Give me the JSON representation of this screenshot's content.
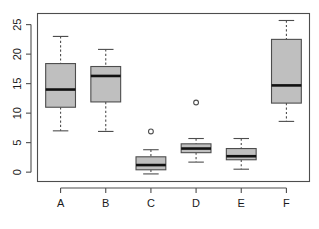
{
  "chart_data": {
    "type": "box",
    "title": "",
    "xlabel": "",
    "ylabel": "",
    "categories": [
      "A",
      "B",
      "C",
      "D",
      "E",
      "F"
    ],
    "ylim": [
      -1.5,
      26.8
    ],
    "yticks": [
      0,
      5,
      10,
      15,
      20,
      25
    ],
    "ytick_labels": [
      "0",
      "5",
      "10",
      "15",
      "20",
      "25"
    ],
    "grid": false,
    "legend": "none",
    "orientation": "vertical",
    "boxes": [
      {
        "category": "A",
        "whisker_low": 7.0,
        "q1": 11.0,
        "median": 14.0,
        "q3": 18.4,
        "whisker_high": 23.0,
        "outliers": []
      },
      {
        "category": "B",
        "whisker_low": 6.9,
        "q1": 11.9,
        "median": 16.3,
        "q3": 17.9,
        "whisker_high": 20.8,
        "outliers": []
      },
      {
        "category": "C",
        "whisker_low": -0.3,
        "q1": 0.4,
        "median": 1.2,
        "q3": 2.6,
        "whisker_high": 3.8,
        "outliers": [
          6.9
        ]
      },
      {
        "category": "D",
        "whisker_low": 1.7,
        "q1": 3.3,
        "median": 4.0,
        "q3": 4.8,
        "whisker_high": 5.7,
        "outliers": [
          11.8
        ]
      },
      {
        "category": "E",
        "whisker_low": 0.5,
        "q1": 2.1,
        "median": 2.7,
        "q3": 4.0,
        "whisker_high": 5.7,
        "outliers": []
      },
      {
        "category": "F",
        "whisker_low": 8.6,
        "q1": 11.7,
        "median": 14.7,
        "q3": 22.5,
        "whisker_high": 25.7,
        "outliers": []
      }
    ],
    "colors": {
      "box_fill": "#bfbfbf",
      "box_stroke": "#4d4d4d",
      "median": "#111111",
      "axis": "#4d4d4d",
      "text": "#1a1a1a",
      "background": "#ffffff"
    }
  }
}
